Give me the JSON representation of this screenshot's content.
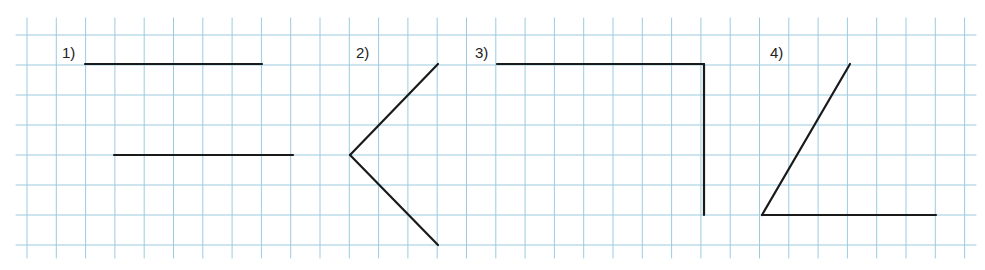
{
  "grid": {
    "color": "#9ccbe0",
    "x_start": 27,
    "x_step": 29.3,
    "x_count": 33,
    "y_start": 35,
    "y_step": 30,
    "y_count": 8,
    "top": 18,
    "bottom": 258,
    "left": 16,
    "right": 976
  },
  "stroke_color": "#1a1a1a",
  "figures": [
    {
      "label": "1)",
      "label_pos": [
        62,
        44
      ],
      "segments": [
        [
          [
            85,
            64
          ],
          [
            262,
            64
          ]
        ],
        [
          [
            114,
            155
          ],
          [
            293,
            155
          ]
        ]
      ]
    },
    {
      "label": "2)",
      "label_pos": [
        356,
        44
      ],
      "segments": [
        [
          [
            350,
            155
          ],
          [
            438,
            64
          ]
        ],
        [
          [
            350,
            155
          ],
          [
            438,
            245
          ]
        ]
      ]
    },
    {
      "label": "3)",
      "label_pos": [
        475,
        44
      ],
      "segments": [
        [
          [
            497,
            64
          ],
          [
            704,
            64
          ]
        ],
        [
          [
            704,
            64
          ],
          [
            704,
            215
          ]
        ]
      ]
    },
    {
      "label": "4)",
      "label_pos": [
        770,
        44
      ],
      "segments": [
        [
          [
            762,
            215
          ],
          [
            850,
            64
          ]
        ],
        [
          [
            762,
            215
          ],
          [
            936,
            215
          ]
        ]
      ]
    }
  ]
}
